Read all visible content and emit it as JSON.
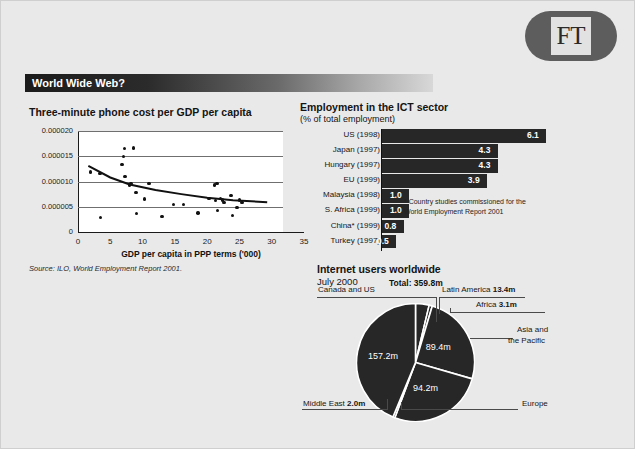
{
  "brand": {
    "logo_text": "FT"
  },
  "header": {
    "title": "World Wide Web?"
  },
  "scatter": {
    "title": "Three-minute phone cost per GDP per capita",
    "xlabel": "GDP per capita in PPP terms ('000)",
    "source": "Source: ILO, World Employment Report 2001."
  },
  "bars": {
    "title": "Employment in the ICT sector",
    "subtitle": "(% of total employment)",
    "footnote": "* Country studies commissioned for the World Employment Report 2001"
  },
  "pie": {
    "title": "Internet users worldwide",
    "date": "July 2000",
    "total": "Total: 359.8m",
    "labels": {
      "canada_us": "Canada and US",
      "latin_america": "Latin America ",
      "latin_america_val": "13.4m",
      "africa": "Africa ",
      "africa_val": "3.1m",
      "asia": "Asia and",
      "asia2": "the Pacific",
      "europe": "Europe",
      "middle_east": "Middle East ",
      "middle_east_val": "2.0m"
    },
    "slice_values": {
      "canada_us": "157.2m",
      "asia": "89.4m",
      "europe": "94.2m"
    }
  },
  "chart_data": [
    {
      "type": "scatter",
      "title": "Three-minute phone cost per GDP per capita",
      "xlabel": "GDP per capita in PPP terms ('000)",
      "ylabel": "",
      "xlim": [
        0,
        35
      ],
      "ylim": [
        0,
        2e-05
      ],
      "xticks": [
        0,
        5,
        10,
        15,
        20,
        25,
        30,
        35
      ],
      "yticks": [
        0,
        5e-06,
        1e-05,
        1.5e-05,
        2e-05
      ],
      "ytick_labels": [
        "0",
        "0.000005",
        "0.000010",
        "0.000015",
        "0.000020"
      ],
      "grid": true,
      "source": "Source: ILO, World Employment Report 2001.",
      "points": [
        [
          1.9,
          1.19e-05
        ],
        [
          3.4,
          1.16e-05
        ],
        [
          3.5,
          2.9e-06
        ],
        [
          6.8,
          1.34e-05
        ],
        [
          7.0,
          1.5e-05
        ],
        [
          7.2,
          1.65e-05
        ],
        [
          7.3,
          1.1e-05
        ],
        [
          8.6,
          1.66e-05
        ],
        [
          8.0,
          9.3e-06
        ],
        [
          8.2,
          9.6e-06
        ],
        [
          9.0,
          7.8e-06
        ],
        [
          9.1,
          3.7e-06
        ],
        [
          10.3,
          6.5e-06
        ],
        [
          11.0,
          9.6e-06
        ],
        [
          13.0,
          3.1e-06
        ],
        [
          14.8,
          5.5e-06
        ],
        [
          16.3,
          5.5e-06
        ],
        [
          18.6,
          3.8e-06
        ],
        [
          20.3,
          6.6e-06
        ],
        [
          21.1,
          9.3e-06
        ],
        [
          21.5,
          9.6e-06
        ],
        [
          21.3,
          6.2e-06
        ],
        [
          21.6,
          4.2e-06
        ],
        [
          22.1,
          6.6e-06
        ],
        [
          22.6,
          5.8e-06
        ],
        [
          22.4,
          6.3e-06
        ],
        [
          23.7,
          7.2e-06
        ],
        [
          23.9,
          3.3e-06
        ],
        [
          24.6,
          4.9e-06
        ],
        [
          25.0,
          6.3e-06
        ],
        [
          25.4,
          5.8e-06
        ]
      ],
      "trendline": [
        [
          1.6,
          1.31e-05
        ],
        [
          5.0,
          1.08e-05
        ],
        [
          8.0,
          9.4e-06
        ],
        [
          12.0,
          8.3e-06
        ],
        [
          16.0,
          7.5e-06
        ],
        [
          20.0,
          6.8e-06
        ],
        [
          24.0,
          6.3e-06
        ],
        [
          29.3,
          5.9e-06
        ]
      ]
    },
    {
      "type": "bar",
      "orientation": "horizontal",
      "title": "Employment in the ICT sector",
      "subtitle": "(% of total employment)",
      "xlabel": "",
      "ylabel": "",
      "xlim": [
        0,
        6.1
      ],
      "categories": [
        "US (1998)",
        "Japan (1997)",
        "Hungary (1997)",
        "EU (1999)",
        "Malaysia (1998)",
        "S. Africa (1999)",
        "China* (1999)",
        "Turkey (1997)"
      ],
      "values": [
        6.1,
        4.3,
        4.3,
        3.9,
        1.0,
        1.0,
        0.8,
        0.5
      ],
      "value_labels": [
        "6.1",
        "4.3",
        "4.3",
        "3.9",
        "1.0",
        "1.0",
        "0.8",
        "0.5"
      ],
      "bar_color": "#272727",
      "note": "* Country studies commissioned for the World Employment Report 2001"
    },
    {
      "type": "pie",
      "title": "Internet users worldwide",
      "subtitle": "July 2000",
      "total": "Total: 359.8m",
      "unit": "m",
      "categories": [
        "Canada and US",
        "Latin America",
        "Africa",
        "Asia and the Pacific",
        "Europe",
        "Middle East"
      ],
      "values": [
        157.2,
        13.4,
        3.1,
        89.4,
        94.2,
        2.0
      ],
      "value_labels": [
        "157.2m",
        "13.4m",
        "3.1m",
        "89.4m",
        "94.2m",
        "2.0m"
      ],
      "slice_color": "#272727",
      "separator_color": "#ffffff"
    }
  ]
}
